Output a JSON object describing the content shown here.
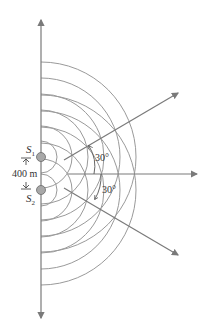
{
  "diagram": {
    "sources": [
      {
        "name": "S",
        "subscript": "1",
        "x": 41,
        "y": 157
      },
      {
        "name": "S",
        "subscript": "2",
        "x": 41,
        "y": 190
      }
    ],
    "separation_label": "400 m",
    "angle_upper_label": "30°",
    "angle_lower_label": "30°",
    "wave_radii": [
      16,
      31,
      47,
      63,
      79,
      95
    ],
    "colors": {
      "line": "#7a7a7a",
      "arc": "#9a9a9a",
      "source_fill": "#a8a8a8",
      "text": "#333333"
    }
  }
}
